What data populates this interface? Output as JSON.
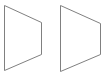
{
  "canvas": {
    "width": 110,
    "height": 76,
    "background_color": "#ffffff",
    "stroke_color": "#808080",
    "stroke_width": 1,
    "fill": "none"
  },
  "shapes": [
    {
      "name": "trapezoid-left",
      "type": "trapezoid",
      "description": "right-pointing trapezoid with tall vertical left edge and short vertical right edge",
      "points": "4.5,5.5 41.5,22.5 41.5,54.5 4.5,70.5",
      "vertices": [
        {
          "label": "top-left",
          "x": 4.5,
          "y": 5.5
        },
        {
          "label": "top-right",
          "x": 41.5,
          "y": 22.5
        },
        {
          "label": "bottom-right",
          "x": 41.5,
          "y": 54.5
        },
        {
          "label": "bottom-left",
          "x": 4.5,
          "y": 70.5
        }
      ],
      "left_edge_height": 65,
      "right_edge_height": 32,
      "width": 37
    },
    {
      "name": "trapezoid-right",
      "type": "trapezoid",
      "description": "right-pointing trapezoid with tall vertical left edge and short vertical right edge",
      "points": "60.5,5.5 100.5,23.5 100.5,54.5 60.5,71.5",
      "vertices": [
        {
          "label": "top-left",
          "x": 60.5,
          "y": 5.5
        },
        {
          "label": "top-right",
          "x": 100.5,
          "y": 23.5
        },
        {
          "label": "bottom-right",
          "x": 100.5,
          "y": 54.5
        },
        {
          "label": "bottom-left",
          "x": 60.5,
          "y": 71.5
        }
      ],
      "left_edge_height": 66,
      "right_edge_height": 31,
      "width": 40
    }
  ]
}
